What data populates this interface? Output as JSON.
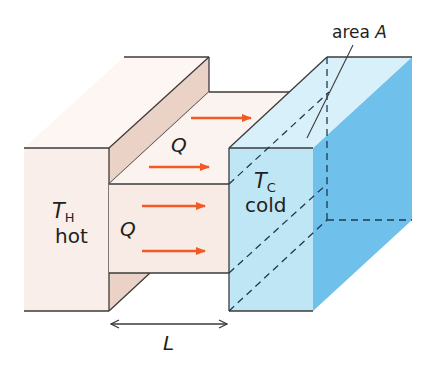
{
  "diagram": {
    "hot_block": {
      "symbol": "T",
      "subscript": "H",
      "label": "hot",
      "color_front": "#f9eee9",
      "color_side": "#ead2c6"
    },
    "cold_block": {
      "symbol": "T",
      "subscript": "C",
      "label": "cold",
      "color_front": "#bfe6f5",
      "color_top": "#d7f0fa",
      "color_side": "#6fc0ea"
    },
    "bar": {
      "color": "#f8ebe5"
    },
    "heat_flow": {
      "label": "Q",
      "arrow_color": "#f15a24",
      "arrow_count": 4
    },
    "area_label": {
      "text": "area",
      "symbol": "A"
    },
    "length_label": {
      "symbol": "L"
    },
    "line_color": "#3d3a3b",
    "dash_color": "#1f3a4d"
  }
}
